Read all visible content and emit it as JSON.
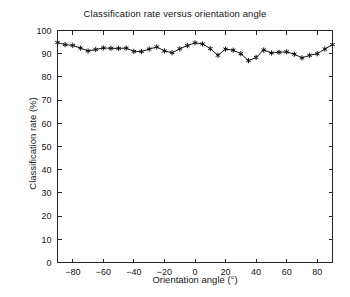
{
  "chart_data": {
    "type": "line",
    "title": "Classification rate versus orientation angle",
    "xlabel": "Orientation angle (°)",
    "ylabel": "Classification rate (%)",
    "xlim": [
      -90,
      90
    ],
    "ylim": [
      0,
      100
    ],
    "xticks": [
      -80,
      -60,
      -40,
      -20,
      0,
      20,
      40,
      60,
      80
    ],
    "yticks": [
      0,
      10,
      20,
      30,
      40,
      50,
      60,
      70,
      80,
      90,
      100
    ],
    "xtick_labels": [
      "−80",
      "−60",
      "−40",
      "−20",
      "0",
      "20",
      "40",
      "60",
      "80"
    ],
    "ytick_labels": [
      "0",
      "10",
      "20",
      "30",
      "40",
      "50",
      "60",
      "70",
      "80",
      "90",
      "100"
    ],
    "grid": false,
    "legend": null,
    "marker": "star",
    "line_color": "#1c1c1c",
    "x": [
      -90,
      -85,
      -80,
      -75,
      -70,
      -65,
      -60,
      -55,
      -50,
      -45,
      -40,
      -35,
      -30,
      -25,
      -20,
      -15,
      -10,
      -5,
      0,
      5,
      10,
      15,
      20,
      25,
      30,
      35,
      40,
      45,
      50,
      55,
      60,
      65,
      70,
      75,
      80,
      85,
      90
    ],
    "values": [
      94.8,
      93.9,
      93.6,
      92.4,
      91.2,
      91.8,
      92.5,
      92.3,
      92.3,
      92.4,
      91.0,
      90.9,
      92.0,
      92.9,
      91.2,
      90.4,
      92.1,
      93.5,
      94.7,
      94.2,
      92.2,
      89.3,
      92.0,
      91.5,
      90.0,
      87.0,
      88.4,
      91.6,
      90.3,
      90.6,
      90.8,
      89.8,
      88.2,
      89.3,
      90.0,
      92.0,
      93.9
    ],
    "series_name": "Classification rate"
  },
  "axes": {
    "title": "Classification rate versus orientation angle",
    "x_label": "Orientation angle (°)",
    "y_label": "Classification rate (%)"
  }
}
